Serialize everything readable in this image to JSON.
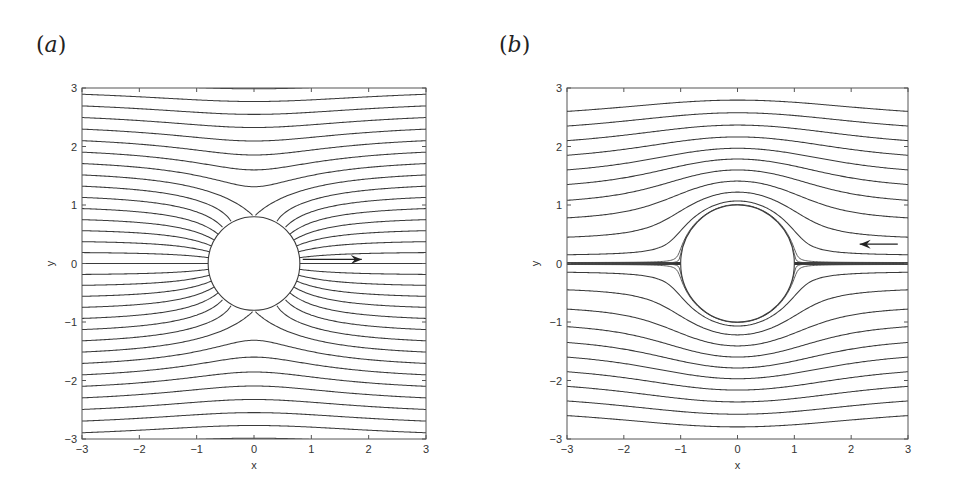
{
  "figure": {
    "width": 957,
    "height": 492
  },
  "chart_data": [
    {
      "type": "line",
      "panel_label": "(a)",
      "panel_letter": "a",
      "title": "",
      "xlabel": "x",
      "ylabel": "y",
      "xlim": [
        -3,
        3
      ],
      "ylim": [
        -3,
        3
      ],
      "xticks": [
        -3,
        -2,
        -1,
        0,
        1,
        2,
        3
      ],
      "yticks": [
        -3,
        -2,
        -1,
        0,
        1,
        2,
        3
      ],
      "xtick_labels": [
        "−3",
        "−2",
        "−1",
        "0",
        "1",
        "2",
        "3"
      ],
      "ytick_labels": [
        "−3",
        "−2",
        "−1",
        "0",
        "1",
        "2",
        "3"
      ],
      "grid": false,
      "description": "Streamlines converging toward a circular body (radius ~0.8) centered at origin",
      "stream_function": "psi = y * (1 + a^2 / (x^2 + y^2))",
      "body_radius": 0.8,
      "psi_step": 0.2,
      "psi_range": [
        -3.4,
        3.4
      ],
      "thin_psi": [],
      "arrow": {
        "from": [
          0.85,
          0.07
        ],
        "to": [
          1.88,
          0.07
        ],
        "direction": "right"
      },
      "pixel_box": {
        "left": 82,
        "right": 426,
        "top": 88,
        "bottom": 439
      }
    },
    {
      "type": "line",
      "panel_label": "(b)",
      "panel_letter": "b",
      "title": "",
      "xlabel": "x",
      "ylabel": "y",
      "xlim": [
        -3,
        3
      ],
      "ylim": [
        -3,
        3
      ],
      "xticks": [
        -3,
        -2,
        -1,
        0,
        1,
        2,
        3
      ],
      "yticks": [
        -3,
        -2,
        -1,
        0,
        1,
        2,
        3
      ],
      "xtick_labels": [
        "−3",
        "−2",
        "−1",
        "0",
        "1",
        "2",
        "3"
      ],
      "ytick_labels": [
        "−3",
        "−2",
        "−1",
        "0",
        "1",
        "2",
        "3"
      ],
      "grid": false,
      "description": "Potential flow streamlines around a unit circular cylinder, flow from right to left",
      "stream_function": "psi = y * (1 - a^2 / (x^2 + y^2))",
      "body_radius": 1.0,
      "seed_y_at_left_edge": [
        0.15,
        0.45,
        0.78,
        1.08,
        1.35,
        1.6,
        1.85,
        2.1,
        2.35,
        2.6
      ],
      "thin_psi": [
        0.004,
        0.015,
        -0.004,
        -0.015
      ],
      "arrow": {
        "from": [
          2.82,
          0.33
        ],
        "to": [
          2.15,
          0.33
        ],
        "direction": "left"
      },
      "pixel_box": {
        "left": 567,
        "right": 908,
        "top": 88,
        "bottom": 439
      }
    }
  ]
}
